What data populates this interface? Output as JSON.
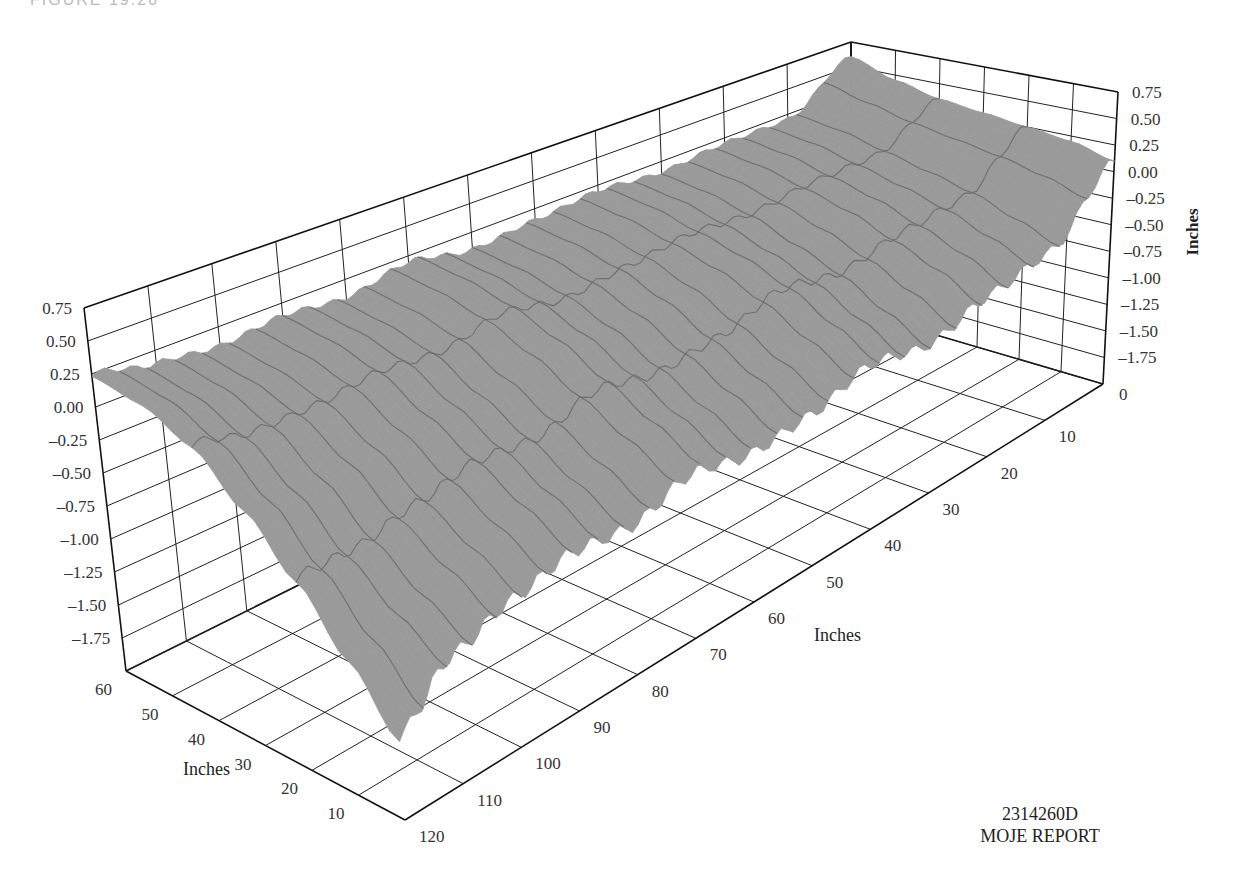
{
  "figure": {
    "caption": "FIGURE 19.26",
    "report_code": "2314260D",
    "report_name": "MOJE REPORT"
  },
  "chart_data": {
    "type": "surface3d",
    "title": "",
    "surface_color": "#9a9a9a",
    "mesh_color": "#6e6e6e",
    "x_axis": {
      "label": "Inches",
      "range": [
        0,
        120
      ],
      "ticks": [
        0,
        10,
        20,
        30,
        40,
        50,
        60,
        70,
        80,
        90,
        100,
        110,
        120
      ]
    },
    "y_axis": {
      "label": "Inches",
      "range": [
        0,
        60
      ],
      "ticks": [
        10,
        20,
        30,
        40,
        50,
        60
      ]
    },
    "z_axis": {
      "label": "Inches",
      "range": [
        -2.0,
        0.75
      ],
      "ticks": [
        "0.75",
        "0.50",
        "0.25",
        "0.00",
        "–0.25",
        "–0.50",
        "–0.75",
        "–1.00",
        "–1.25",
        "–1.50",
        "–1.75"
      ]
    },
    "grid": true,
    "x_samples": [
      0,
      10,
      20,
      30,
      40,
      50,
      60,
      70,
      80,
      90,
      100,
      110,
      120
    ],
    "y_samples": [
      0,
      10,
      20,
      30,
      40,
      50,
      60
    ],
    "z_values": [
      [
        0.1,
        -0.45,
        -0.55,
        -0.7,
        -0.6,
        -0.75,
        -0.8,
        -0.7,
        -0.85,
        -0.8,
        -0.9,
        -1.05,
        -1.4
      ],
      [
        0.2,
        -0.3,
        -0.35,
        -0.5,
        -0.4,
        -0.55,
        -0.6,
        -0.5,
        -0.65,
        -0.6,
        -0.7,
        -0.85,
        -1.0
      ],
      [
        0.25,
        -0.15,
        -0.2,
        -0.3,
        -0.2,
        -0.35,
        -0.4,
        -0.3,
        -0.45,
        -0.4,
        -0.5,
        -0.6,
        -0.6
      ],
      [
        0.3,
        -0.05,
        -0.05,
        -0.15,
        -0.05,
        -0.15,
        -0.2,
        -0.1,
        -0.25,
        -0.2,
        -0.25,
        -0.3,
        -0.25
      ],
      [
        0.35,
        0.05,
        0.05,
        0.0,
        0.05,
        0.0,
        -0.05,
        0.05,
        -0.05,
        0.0,
        -0.05,
        -0.05,
        0.05
      ],
      [
        0.45,
        0.15,
        0.15,
        0.1,
        0.15,
        0.1,
        0.05,
        0.15,
        0.05,
        0.1,
        0.05,
        0.1,
        0.2
      ],
      [
        0.6,
        0.2,
        0.2,
        0.15,
        0.2,
        0.15,
        0.1,
        0.2,
        0.1,
        0.15,
        0.1,
        0.15,
        0.25
      ]
    ],
    "ripple": {
      "amplitude": 0.05,
      "period_inches": 4.5
    }
  }
}
